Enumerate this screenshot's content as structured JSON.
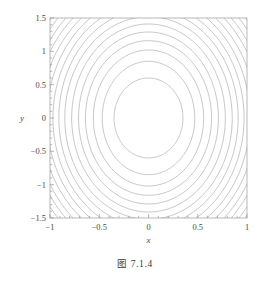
{
  "figure": {
    "caption": "图 7.1.4"
  },
  "chart_data": {
    "type": "line",
    "subtype": "contour",
    "title": "",
    "subtitle": "",
    "xlabel": "x",
    "ylabel": "y",
    "xlim": [
      -1,
      1
    ],
    "ylim": [
      -1.5,
      1.5
    ],
    "grid": false,
    "legend": null,
    "frame": true,
    "xticks": [
      -1,
      -0.5,
      0,
      0.5,
      1
    ],
    "xtick_labels": [
      "-1",
      "-0.5",
      "0",
      "0.5",
      "1"
    ],
    "yticks": [
      -1.5,
      -1,
      -0.5,
      0,
      0.5,
      1,
      1.5
    ],
    "ytick_labels": [
      "-1.5",
      "-1",
      "-0.5",
      "0",
      "0.5",
      "1",
      "1.5"
    ],
    "minor_ticks_per_interval": 4,
    "line_color": "#9a9a9a",
    "frame_color": "#9a9a9a",
    "background": "#ffffff",
    "contours": {
      "center": [
        0,
        0
      ],
      "description": "Concentric elliptical level curves of a convex function centred at the origin, elongated along the y-axis, spaced at equal level increments so curves crowd together toward the corners of the frame.",
      "x_semi_axes": [
        0.35,
        0.47,
        0.56,
        0.64,
        0.71,
        0.78,
        0.85,
        0.91,
        0.97,
        1.03,
        1.09,
        1.15,
        1.2,
        1.26,
        1.31,
        1.36,
        1.41,
        1.46,
        1.51,
        1.56,
        1.61,
        1.66,
        1.7,
        1.75,
        1.79
      ],
      "y_semi_axes": [
        0.6,
        0.85,
        1.02,
        1.16,
        1.29,
        1.41,
        1.52,
        1.63,
        1.73,
        1.83,
        1.92,
        2.01,
        2.1,
        2.19,
        2.27,
        2.35,
        2.43,
        2.51,
        2.59,
        2.66,
        2.74,
        2.81,
        2.88,
        2.95,
        3.02
      ],
      "aspect_ratio_y_over_x": 1.72,
      "count": 25
    }
  }
}
